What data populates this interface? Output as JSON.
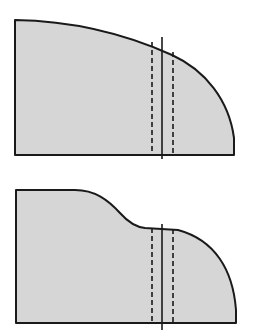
{
  "diagram": {
    "colors": {
      "fill": "#d6d6d6",
      "stroke": "#1a1a1a",
      "background": "#ffffff"
    },
    "figures": [
      {
        "id": "upper-profile",
        "description": "Convex curved cross-section with cut plane",
        "outline_path": "M15,20 L15,155 L234,155 L234,138 C229,100 205,70 172,55 C130,36 80,21 15,20 Z",
        "dashed_lines": [
          {
            "x": 152,
            "y1": 42,
            "y2": 155
          },
          {
            "x": 173,
            "y1": 52,
            "y2": 155
          }
        ],
        "center_line": {
          "x": 162,
          "y1": 37,
          "y2": 159
        }
      },
      {
        "id": "lower-profile",
        "description": "S-curved cross-section with plateau and cut plane",
        "outline_path": "M16,190 L16,323 L236,323 L236,310 C233,270 215,240 178,230 L145,228 C135,227 128,222 120,213 C108,200 95,190 75,190 Z",
        "dashed_lines": [
          {
            "x": 152,
            "y1": 228,
            "y2": 323
          },
          {
            "x": 173,
            "y1": 229,
            "y2": 323
          }
        ],
        "center_line": {
          "x": 162,
          "y1": 224,
          "y2": 330
        }
      }
    ]
  }
}
